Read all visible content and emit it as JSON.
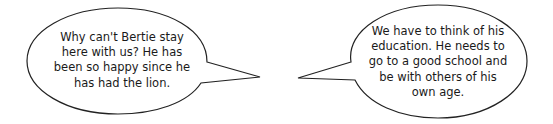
{
  "bubbles": {
    "left": {
      "lines": [
        "Why can't Bertie stay",
        "here with us? He has",
        "been so happy since he",
        "has had the lion."
      ]
    },
    "right": {
      "lines": [
        "We have to think of his",
        "education. He needs to",
        "go to a good school and",
        "be with others of his",
        "own age."
      ]
    }
  },
  "colors": {
    "stroke": "#222222",
    "text": "#1a1a1a",
    "background": "#ffffff"
  }
}
